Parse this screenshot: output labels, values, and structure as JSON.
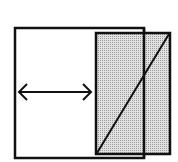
{
  "diagram": {
    "colors": {
      "stroke": "#111111",
      "background": "#ffffff",
      "shade": "#c8c8c8"
    },
    "outer_rect": {
      "x": 15,
      "y": 28,
      "width": 129,
      "height": 130
    },
    "shaded_rect": {
      "x": 96,
      "y": 33,
      "width": 74,
      "height": 121
    },
    "diagonal": {
      "x1": 97,
      "y1": 153,
      "x2": 169,
      "y2": 34
    },
    "arrow": {
      "x1": 19,
      "y1": 92,
      "x2": 91,
      "y2": 92,
      "icon": "double-arrow-horizontal"
    }
  }
}
